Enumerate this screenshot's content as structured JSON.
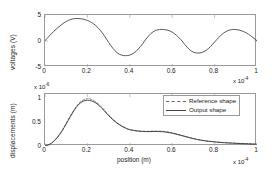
{
  "figure": {
    "panels": [
      {
        "id": "voltages-panel",
        "ylabel": "voltages   (V)",
        "xlabel": "",
        "y_exponent_label": "",
        "x_exponent_mantissa": "x 10",
        "x_exponent_power": "-4",
        "yticks": [
          "-5",
          "0",
          "5"
        ],
        "xticks": [
          "0",
          "0.2",
          "0.4",
          "0.6",
          "0.8",
          "1"
        ]
      },
      {
        "id": "displacements-panel",
        "ylabel": "displacements   (m)",
        "xlabel": "position     (m)",
        "y_exponent_mantissa": "x 10",
        "y_exponent_power": "-6",
        "x_exponent_mantissa": "x 10",
        "x_exponent_power": "-4",
        "yticks": [
          "0",
          "0.5",
          "1"
        ],
        "xticks": [
          "0",
          "0.2",
          "0.4",
          "0.6",
          "0.8",
          "1"
        ]
      }
    ],
    "legend": {
      "items": [
        {
          "label": "Reference shape",
          "style": "dashed",
          "color": "#666666"
        },
        {
          "label": "Output shape",
          "style": "solid",
          "color": "#444444"
        }
      ]
    }
  },
  "chart_data": [
    {
      "type": "line",
      "id": "voltages",
      "title": "",
      "xlabel": "",
      "ylabel": "voltages (V)",
      "x_unit_multiplier": 0.0001,
      "y_unit_multiplier": 1,
      "xlim": [
        0,
        1
      ],
      "ylim": [
        -5,
        5
      ],
      "xticks": [
        0,
        0.2,
        0.4,
        0.6,
        0.8,
        1
      ],
      "yticks": [
        -5,
        0,
        5
      ],
      "grid": false,
      "legend": "none",
      "series": [
        {
          "name": "voltages",
          "color": "#444444",
          "style": "solid",
          "x": [
            0,
            0.02,
            0.04,
            0.06,
            0.08,
            0.1,
            0.12,
            0.14,
            0.16,
            0.18,
            0.2,
            0.22,
            0.24,
            0.26,
            0.28,
            0.3,
            0.32,
            0.34,
            0.36,
            0.38,
            0.4,
            0.42,
            0.44,
            0.46,
            0.48,
            0.5,
            0.52,
            0.54,
            0.56,
            0.58,
            0.6,
            0.62,
            0.64,
            0.66,
            0.68,
            0.7,
            0.72,
            0.74,
            0.76,
            0.78,
            0.8,
            0.82,
            0.84,
            0.86,
            0.88,
            0.9,
            0.92,
            0.94,
            0.96,
            0.98,
            1.0
          ],
          "y": [
            0.05,
            0.95,
            1.8,
            2.55,
            3.2,
            3.75,
            4.12,
            4.3,
            4.32,
            4.2,
            3.95,
            3.55,
            2.95,
            2.1,
            1.0,
            -0.25,
            -1.4,
            -2.25,
            -2.7,
            -2.82,
            -2.7,
            -2.3,
            -1.55,
            -0.55,
            0.55,
            1.45,
            2.0,
            2.2,
            2.2,
            2.05,
            1.7,
            1.1,
            0.3,
            -0.7,
            -1.6,
            -2.15,
            -2.32,
            -2.2,
            -1.8,
            -1.1,
            -0.2,
            0.7,
            1.45,
            1.95,
            2.18,
            2.2,
            2.05,
            1.75,
            1.3,
            0.7,
            0.05
          ]
        }
      ]
    },
    {
      "type": "line",
      "id": "displacements",
      "title": "",
      "xlabel": "position (m)",
      "ylabel": "displacements (m)",
      "x_unit_multiplier": 0.0001,
      "y_unit_multiplier": 1e-06,
      "xlim": [
        0,
        1
      ],
      "ylim": [
        0,
        1.12
      ],
      "xticks": [
        0,
        0.2,
        0.4,
        0.6,
        0.8,
        1
      ],
      "yticks": [
        0,
        0.5,
        1
      ],
      "grid": false,
      "legend": "top-right",
      "series": [
        {
          "name": "Reference shape",
          "color": "#6e6e6e",
          "style": "dashed",
          "x": [
            0,
            0.02,
            0.04,
            0.06,
            0.08,
            0.1,
            0.12,
            0.14,
            0.16,
            0.18,
            0.2,
            0.22,
            0.24,
            0.26,
            0.28,
            0.3,
            0.32,
            0.34,
            0.36,
            0.38,
            0.4,
            0.44,
            0.48,
            0.52,
            0.56,
            0.6,
            0.64,
            0.68,
            0.72,
            0.76,
            0.8,
            0.84,
            0.88,
            0.92,
            0.96,
            1.0
          ],
          "y": [
            0.0,
            0.035,
            0.1,
            0.2,
            0.33,
            0.49,
            0.65,
            0.8,
            0.92,
            0.99,
            1.02,
            1.0,
            0.95,
            0.87,
            0.77,
            0.67,
            0.58,
            0.5,
            0.44,
            0.39,
            0.355,
            0.325,
            0.315,
            0.32,
            0.315,
            0.285,
            0.235,
            0.185,
            0.14,
            0.11,
            0.09,
            0.075,
            0.065,
            0.055,
            0.048,
            0.04
          ]
        },
        {
          "name": "Output shape",
          "color": "#3a3a3a",
          "style": "solid",
          "x": [
            0,
            0.02,
            0.04,
            0.06,
            0.08,
            0.1,
            0.12,
            0.14,
            0.16,
            0.18,
            0.2,
            0.22,
            0.24,
            0.26,
            0.28,
            0.3,
            0.32,
            0.34,
            0.36,
            0.38,
            0.4,
            0.44,
            0.48,
            0.52,
            0.56,
            0.6,
            0.64,
            0.68,
            0.72,
            0.76,
            0.8,
            0.84,
            0.88,
            0.92,
            0.96,
            1.0
          ],
          "y": [
            0.0,
            0.03,
            0.095,
            0.195,
            0.32,
            0.475,
            0.635,
            0.785,
            0.9,
            0.965,
            0.985,
            0.97,
            0.925,
            0.85,
            0.755,
            0.655,
            0.565,
            0.49,
            0.43,
            0.385,
            0.35,
            0.32,
            0.31,
            0.312,
            0.305,
            0.275,
            0.23,
            0.18,
            0.138,
            0.108,
            0.088,
            0.072,
            0.062,
            0.053,
            0.046,
            0.038
          ]
        }
      ]
    }
  ]
}
